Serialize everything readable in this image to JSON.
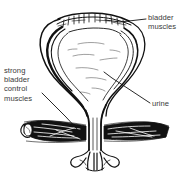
{
  "figure": {
    "background_color": "#ffffff",
    "ink_color": "#111111",
    "text_color": "#3a3a3a",
    "style": "hand-drawn pen and ink cross-section"
  },
  "labels": {
    "bladder_muscles": {
      "line1": "bladder",
      "line2": "muscles"
    },
    "strong_bladder_control_muscles": {
      "line1": "strong",
      "line2": "bladder",
      "line3": "control",
      "line4": "muscles"
    },
    "urine": {
      "line1": "urine"
    }
  },
  "parts": [
    "bladder-dome",
    "bladder-wall",
    "bladder-cavity",
    "bladder-neck",
    "urethra",
    "pelvic-floor-muscle-band",
    "urethral-outlet"
  ],
  "leader_lines": [
    "leader-bladder-muscles",
    "leader-strong-bladder-control-muscles",
    "leader-urine"
  ]
}
